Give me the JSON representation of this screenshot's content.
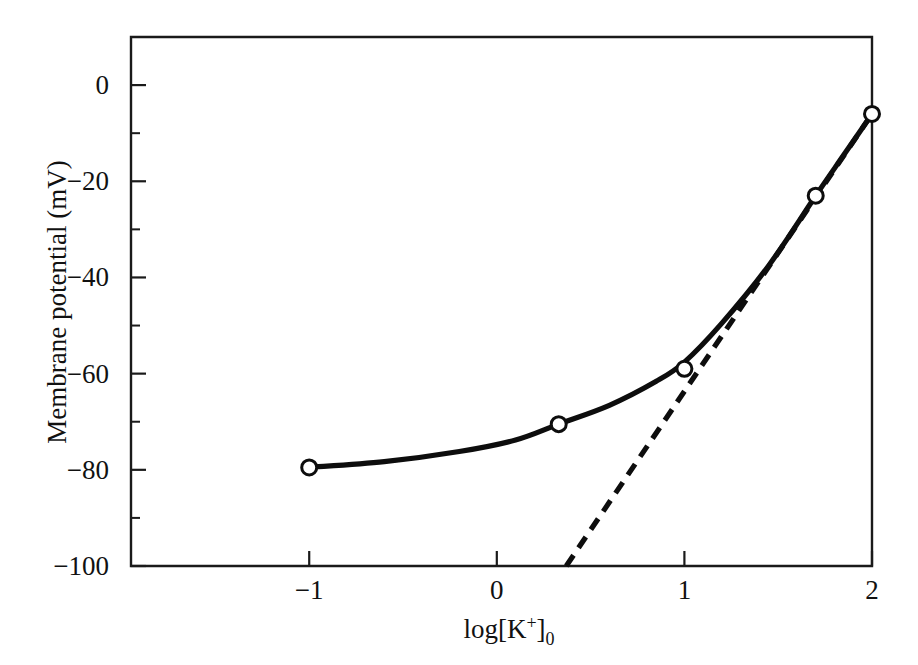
{
  "chart_data": {
    "type": "line",
    "title": "",
    "xlabel": "log[K+]0",
    "xlabel_parts": {
      "base": "log[K",
      "sup": "+",
      "mid": "]",
      "sub": "0"
    },
    "ylabel": "Membrane potential (mV)",
    "xlim": [
      -1.95,
      2.0
    ],
    "ylim": [
      -100,
      10
    ],
    "grid": false,
    "legend": "none",
    "x_ticks": [
      -1,
      0,
      1,
      2
    ],
    "x_tick_labels": [
      "−1",
      "0",
      "1",
      "2"
    ],
    "y_ticks": [
      0,
      -20,
      -40,
      -60,
      -80,
      -100
    ],
    "y_tick_labels": [
      "0",
      "−20",
      "−40",
      "−60",
      "−80",
      "−100"
    ],
    "y_minor_ticks": [
      -10,
      -30,
      -50,
      -70,
      -90
    ],
    "series": [
      {
        "name": "Measured membrane potential",
        "style": "solid",
        "marker": "open-circle",
        "points": [
          {
            "x": -1.0,
            "y": -79.5
          },
          {
            "x": 0.33,
            "y": -70.5
          },
          {
            "x": 1.0,
            "y": -59.0
          },
          {
            "x": 1.7,
            "y": -23.0
          },
          {
            "x": 2.0,
            "y": -6.0
          }
        ],
        "curve_path": [
          {
            "x": -1.0,
            "y": -79.5
          },
          {
            "x": -0.6,
            "y": -78.3
          },
          {
            "x": -0.2,
            "y": -76.2
          },
          {
            "x": 0.1,
            "y": -73.8
          },
          {
            "x": 0.33,
            "y": -70.5
          },
          {
            "x": 0.6,
            "y": -66.6
          },
          {
            "x": 0.85,
            "y": -61.6
          },
          {
            "x": 1.0,
            "y": -57.6
          },
          {
            "x": 1.2,
            "y": -49.5
          },
          {
            "x": 1.45,
            "y": -37.5
          },
          {
            "x": 1.7,
            "y": -23.0
          },
          {
            "x": 1.85,
            "y": -14.5
          },
          {
            "x": 2.0,
            "y": -6.0
          }
        ]
      },
      {
        "name": "Nernst relation",
        "style": "dashed",
        "marker": "none",
        "points": [
          {
            "x": 0.37,
            "y": -100.0
          },
          {
            "x": 2.0,
            "y": -6.0
          }
        ]
      }
    ]
  }
}
